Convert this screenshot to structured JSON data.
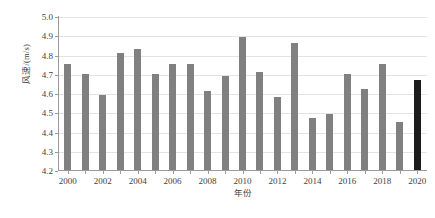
{
  "chart_data": {
    "type": "bar",
    "title": "",
    "xlabel": "年份",
    "ylabel": "风速/(m/s)",
    "ylim": [
      4.2,
      5.0
    ],
    "ytick_labels": [
      "5.0",
      "4.9",
      "4.8",
      "4.7",
      "4.6",
      "4.5",
      "4.4",
      "4.3",
      "4.2"
    ],
    "ytick_values": [
      5.0,
      4.9,
      4.8,
      4.7,
      4.6,
      4.5,
      4.4,
      4.3,
      4.2
    ],
    "xtick_labels": [
      "2000",
      "2002",
      "2004",
      "2006",
      "2008",
      "2010",
      "2012",
      "2014",
      "2016",
      "2018",
      "2020"
    ],
    "categories": [
      "2000",
      "2001",
      "2002",
      "2003",
      "2004",
      "2005",
      "2006",
      "2007",
      "2008",
      "2009",
      "2010",
      "2011",
      "2012",
      "2013",
      "2014",
      "2015",
      "2016",
      "2017",
      "2018",
      "2019",
      "2020"
    ],
    "values": [
      4.75,
      4.7,
      4.59,
      4.81,
      4.83,
      4.7,
      4.75,
      4.75,
      4.61,
      4.69,
      4.89,
      4.71,
      4.58,
      4.86,
      4.47,
      4.49,
      4.7,
      4.62,
      4.75,
      4.45,
      4.67
    ],
    "bar_color": "#808080",
    "highlight_color": "#1c1c1c",
    "highlight_category": "2020",
    "grid": true,
    "legend": "none"
  }
}
